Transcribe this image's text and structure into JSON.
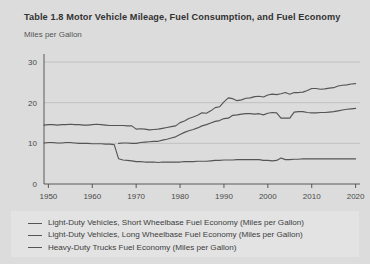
{
  "chart_data": {
    "type": "line",
    "title": "Table 1.8 Motor Vehicle Mileage, Fuel Consumption, and Fuel Economy",
    "subtitle": "Miles per Gallon",
    "xlabel": "",
    "ylabel": "Miles per Gallon",
    "xlim": [
      1949,
      2021
    ],
    "ylim": [
      0,
      31
    ],
    "yticks": [
      0,
      10,
      20,
      30
    ],
    "ytick_labels": [
      "0",
      "10",
      "20",
      "30"
    ],
    "xticks": [
      1950,
      1960,
      1970,
      1980,
      1990,
      2000,
      2010,
      2020
    ],
    "xtick_labels": [
      "1950",
      "1960",
      "1970",
      "1980",
      "1990",
      "2000",
      "2010",
      "2020"
    ],
    "grid": true,
    "legend_position": "bottom",
    "line_color": "#555555",
    "background_color": "#dcdcdc",
    "legend_background": "#e3e3e3",
    "series": [
      {
        "name": "Light-Duty Vehicles, Short Wheelbase Fuel Economy (Miles per Gallon)",
        "color": "#555555",
        "x": [
          1949,
          1950,
          1951,
          1952,
          1953,
          1954,
          1955,
          1956,
          1957,
          1958,
          1959,
          1960,
          1961,
          1962,
          1963,
          1964,
          1965,
          1966,
          1967,
          1968,
          1969,
          1970,
          1971,
          1972,
          1973,
          1974,
          1975,
          1976,
          1977,
          1978,
          1979,
          1980,
          1981,
          1982,
          1983,
          1984,
          1985,
          1986,
          1987,
          1988,
          1989,
          1990,
          1991,
          1992,
          1993,
          1994,
          1995,
          1996,
          1997,
          1998,
          1999,
          2000,
          2001,
          2002,
          2003,
          2004,
          2005,
          2006,
          2007,
          2008,
          2009,
          2010,
          2011,
          2012,
          2013,
          2014,
          2015,
          2016,
          2017,
          2018,
          2019,
          2020
        ],
        "y": [
          14.5,
          14.6,
          14.6,
          14.5,
          14.6,
          14.6,
          14.7,
          14.6,
          14.6,
          14.5,
          14.5,
          14.6,
          14.7,
          14.6,
          14.5,
          14.4,
          14.4,
          14.4,
          14.4,
          14.3,
          14.3,
          13.5,
          13.6,
          13.5,
          13.3,
          13.4,
          13.5,
          13.7,
          13.9,
          14.1,
          14.3,
          15.1,
          15.5,
          16.1,
          16.5,
          16.9,
          17.5,
          17.4,
          18.0,
          18.8,
          19.0,
          20.2,
          21.2,
          21.0,
          20.5,
          20.7,
          21.1,
          21.2,
          21.5,
          21.6,
          21.4,
          21.9,
          22.1,
          22.0,
          22.2,
          22.5,
          22.1,
          22.5,
          22.5,
          22.6,
          23.0,
          23.5,
          23.5,
          23.3,
          23.4,
          23.6,
          23.7,
          24.1,
          24.3,
          24.4,
          24.6,
          24.7
        ],
        "start_value": 14.5,
        "end_value": 24.7
      },
      {
        "name": "Light-Duty Vehicles, Long Wheelbase Fuel Economy (Miles per Gallon)",
        "color": "#555555",
        "x": [
          1966,
          1967,
          1968,
          1969,
          1970,
          1971,
          1972,
          1973,
          1974,
          1975,
          1976,
          1977,
          1978,
          1979,
          1980,
          1981,
          1982,
          1983,
          1984,
          1985,
          1986,
          1987,
          1988,
          1989,
          1990,
          1991,
          1992,
          1993,
          1994,
          1995,
          1996,
          1997,
          1998,
          1999,
          2000,
          2001,
          2002,
          2003,
          2004,
          2005,
          2006,
          2007,
          2008,
          2009,
          2010,
          2011,
          2012,
          2013,
          2014,
          2015,
          2016,
          2017,
          2018,
          2019,
          2020
        ],
        "y": [
          10.0,
          10.1,
          10.1,
          10.0,
          10.0,
          10.2,
          10.3,
          10.4,
          10.5,
          10.5,
          10.8,
          11.0,
          11.3,
          11.6,
          12.2,
          12.7,
          13.1,
          13.4,
          13.8,
          14.3,
          14.6,
          15.0,
          15.4,
          15.6,
          16.1,
          16.2,
          16.9,
          17.0,
          17.2,
          17.3,
          17.3,
          17.2,
          17.3,
          17.0,
          17.4,
          17.6,
          17.5,
          16.2,
          16.2,
          16.2,
          17.7,
          17.8,
          17.8,
          17.6,
          17.5,
          17.5,
          17.6,
          17.6,
          17.7,
          17.8,
          18.0,
          18.2,
          18.4,
          18.5,
          18.6
        ],
        "start_value": 10.0,
        "end_value": 18.6
      },
      {
        "name": "Heavy-Duty Trucks Fuel Economy (Miles per Gallon)",
        "color": "#555555",
        "x": [
          1949,
          1950,
          1951,
          1952,
          1953,
          1954,
          1955,
          1956,
          1957,
          1958,
          1959,
          1960,
          1961,
          1962,
          1963,
          1964,
          1965,
          1966,
          1967,
          1968,
          1969,
          1970,
          1971,
          1972,
          1973,
          1974,
          1975,
          1976,
          1977,
          1978,
          1979,
          1980,
          1981,
          1982,
          1983,
          1984,
          1985,
          1986,
          1987,
          1988,
          1989,
          1990,
          1991,
          1992,
          1993,
          1994,
          1995,
          1996,
          1997,
          1998,
          1999,
          2000,
          2001,
          2002,
          2003,
          2004,
          2005,
          2006,
          2007,
          2008,
          2009,
          2010,
          2011,
          2012,
          2013,
          2014,
          2015,
          2016,
          2017,
          2018,
          2019,
          2020
        ],
        "y": [
          10.1,
          10.2,
          10.2,
          10.1,
          10.1,
          10.2,
          10.2,
          10.1,
          10.0,
          10.0,
          10.0,
          9.9,
          9.9,
          9.9,
          9.8,
          9.8,
          9.7,
          6.2,
          5.9,
          5.8,
          5.7,
          5.5,
          5.5,
          5.4,
          5.4,
          5.4,
          5.3,
          5.4,
          5.4,
          5.4,
          5.4,
          5.4,
          5.5,
          5.5,
          5.5,
          5.6,
          5.6,
          5.6,
          5.7,
          5.8,
          5.8,
          5.9,
          5.9,
          5.9,
          6.0,
          6.0,
          6.0,
          6.0,
          6.0,
          6.0,
          5.8,
          5.8,
          5.7,
          5.8,
          6.4,
          6.0,
          6.0,
          6.1,
          6.1,
          6.2,
          6.2,
          6.2,
          6.2,
          6.2,
          6.2,
          6.2,
          6.2,
          6.2,
          6.2,
          6.2,
          6.2,
          6.2
        ],
        "start_value": 10.1,
        "end_value": 6.2
      }
    ]
  },
  "legend": {
    "items": [
      {
        "label": "Light-Duty Vehicles, Short Wheelbase Fuel Economy (Miles per Gallon)"
      },
      {
        "label": "Light-Duty Vehicles, Long Wheelbase Fuel Economy (Miles per Gallon)"
      },
      {
        "label": "Heavy-Duty Trucks Fuel Economy (Miles per Gallon)"
      }
    ]
  }
}
